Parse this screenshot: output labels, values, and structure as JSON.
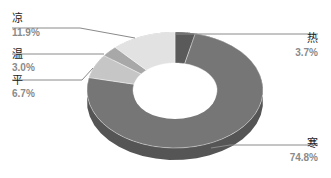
{
  "chart_data": {
    "type": "pie",
    "variant": "3d-donut",
    "title": "",
    "categories": [
      "热",
      "寒",
      "平",
      "温",
      "凉"
    ],
    "values": [
      3.7,
      74.8,
      6.7,
      3.0,
      11.9
    ],
    "unit": "%",
    "colors": [
      "#5a5a5a",
      "#767676",
      "#c6c6c6",
      "#a8a8a8",
      "#e2e2e2"
    ],
    "labels": [
      {
        "name": "热",
        "pct": "3.7%"
      },
      {
        "name": "寒",
        "pct": "74.8%"
      },
      {
        "name": "平",
        "pct": "6.7%"
      },
      {
        "name": "温",
        "pct": "3.0%"
      },
      {
        "name": "凉",
        "pct": "11.9%"
      }
    ],
    "legend": "none (leader-line labels)"
  }
}
